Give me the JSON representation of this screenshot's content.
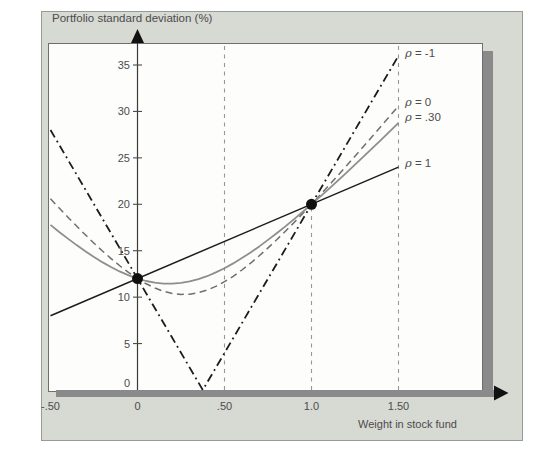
{
  "header": {
    "title": "Portfolio standard deviation (%)"
  },
  "chart_data": {
    "type": "line",
    "title": "Portfolio standard deviation (%)",
    "xlabel": "Weight in stock fund",
    "ylabel": "Portfolio standard deviation (%)",
    "xlim": [
      -0.5,
      1.5
    ],
    "ylim": [
      0,
      37.4
    ],
    "grid": "off",
    "legend_position": "right of curves at x = 1.50",
    "x_ticks": [
      {
        "value": -0.5,
        "label": "-.50"
      },
      {
        "value": 0,
        "label": "0"
      },
      {
        "value": 0.5,
        "label": ".50"
      },
      {
        "value": 1.0,
        "label": "1.0"
      },
      {
        "value": 1.5,
        "label": "1.50"
      }
    ],
    "y_ticks": [
      {
        "value": 35,
        "label": "35"
      },
      {
        "value": 30,
        "label": "30"
      },
      {
        "value": 25,
        "label": "25"
      },
      {
        "value": 20,
        "label": "20"
      },
      {
        "value": 15,
        "label": "15"
      },
      {
        "value": 10,
        "label": "10"
      },
      {
        "value": 5,
        "label": "5"
      },
      {
        "value": 0,
        "label": "0"
      }
    ],
    "guides": [
      {
        "x": 0.5,
        "y_from": 0,
        "y_to": 37.4
      },
      {
        "x": 1.0,
        "y_from": 0,
        "y_to": 20
      },
      {
        "x": 1.5,
        "y_from": 0,
        "y_to": 37.4
      }
    ],
    "series": [
      {
        "name": "rho-neg1",
        "label": "ρ = -1",
        "style": "dashdot",
        "color": "#1c1c1c",
        "points": [
          [
            -0.5,
            28
          ],
          [
            0.375,
            0
          ],
          [
            1.5,
            36
          ]
        ]
      },
      {
        "name": "rho-0",
        "label": "ρ = 0",
        "style": "dashed",
        "color": "#6f6f6f",
        "points": [
          [
            -0.5,
            20.59
          ],
          [
            -0.45,
            19.59
          ],
          [
            -0.4,
            18.61
          ],
          [
            -0.35,
            17.65
          ],
          [
            -0.3,
            16.71
          ],
          [
            -0.25,
            15.81
          ],
          [
            -0.2,
            14.95
          ],
          [
            -0.15,
            14.12
          ],
          [
            -0.1,
            13.35
          ],
          [
            -0.05,
            12.64
          ],
          [
            0,
            12
          ],
          [
            0.05,
            11.44
          ],
          [
            0.1,
            10.98
          ],
          [
            0.15,
            10.63
          ],
          [
            0.2,
            10.4
          ],
          [
            0.25,
            10.3
          ],
          [
            0.3,
            10.32
          ],
          [
            0.35,
            10.48
          ],
          [
            0.4,
            10.76
          ],
          [
            0.45,
            11.16
          ],
          [
            0.5,
            11.66
          ],
          [
            0.55,
            12.25
          ],
          [
            0.6,
            12.92
          ],
          [
            0.65,
            13.66
          ],
          [
            0.7,
            14.46
          ],
          [
            0.75,
            15.3
          ],
          [
            0.8,
            16.18
          ],
          [
            0.85,
            17.1
          ],
          [
            0.9,
            18.04
          ],
          [
            0.95,
            19.01
          ],
          [
            1,
            20
          ],
          [
            1.05,
            21.01
          ],
          [
            1.1,
            22.03
          ],
          [
            1.15,
            23.07
          ],
          [
            1.2,
            24.12
          ],
          [
            1.25,
            25.18
          ],
          [
            1.3,
            26.25
          ],
          [
            1.35,
            27.32
          ],
          [
            1.4,
            28.41
          ],
          [
            1.45,
            29.5
          ],
          [
            1.5,
            30.59
          ]
        ]
      },
      {
        "name": "rho-30",
        "label": "ρ = .30",
        "style": "solid",
        "color": "#8e8e8e",
        "points": [
          [
            -0.5,
            17.78
          ],
          [
            -0.45,
            17.02
          ],
          [
            -0.4,
            16.3
          ],
          [
            -0.35,
            15.6
          ],
          [
            -0.3,
            14.94
          ],
          [
            -0.25,
            14.32
          ],
          [
            -0.2,
            13.74
          ],
          [
            -0.15,
            13.21
          ],
          [
            -0.1,
            12.74
          ],
          [
            -0.05,
            12.34
          ],
          [
            0,
            12
          ],
          [
            0.05,
            11.74
          ],
          [
            0.1,
            11.56
          ],
          [
            0.15,
            11.46
          ],
          [
            0.2,
            11.45
          ],
          [
            0.25,
            11.53
          ],
          [
            0.3,
            11.7
          ],
          [
            0.35,
            11.94
          ],
          [
            0.4,
            12.26
          ],
          [
            0.45,
            12.66
          ],
          [
            0.5,
            13.11
          ],
          [
            0.55,
            13.63
          ],
          [
            0.6,
            14.2
          ],
          [
            0.65,
            14.81
          ],
          [
            0.7,
            15.47
          ],
          [
            0.75,
            16.16
          ],
          [
            0.8,
            16.88
          ],
          [
            0.85,
            17.62
          ],
          [
            0.9,
            18.4
          ],
          [
            0.95,
            19.19
          ],
          [
            1,
            20
          ],
          [
            1.05,
            20.83
          ],
          [
            1.1,
            21.67
          ],
          [
            1.15,
            22.53
          ],
          [
            1.2,
            23.39
          ],
          [
            1.25,
            24.27
          ],
          [
            1.3,
            25.16
          ],
          [
            1.35,
            26.05
          ],
          [
            1.4,
            26.95
          ],
          [
            1.45,
            27.86
          ],
          [
            1.5,
            28.77
          ]
        ]
      },
      {
        "name": "rho-1",
        "label": "ρ = 1",
        "style": "solid",
        "color": "#1c1c1c",
        "points": [
          [
            -0.5,
            8
          ],
          [
            1.5,
            24
          ]
        ]
      }
    ],
    "markers": [
      {
        "x": 0,
        "y": 12
      },
      {
        "x": 1.0,
        "y": 20
      }
    ]
  }
}
